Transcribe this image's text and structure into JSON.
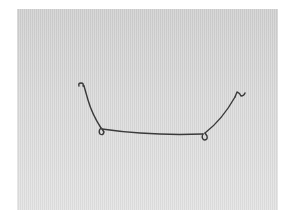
{
  "image": {
    "subject": "bent-metal-wire",
    "background_color": "#d6d6d6",
    "page_background": "#ffffff",
    "wire_color": "#3a3a3a"
  }
}
